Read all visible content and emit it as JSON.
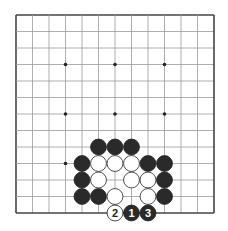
{
  "board": {
    "size": 13,
    "origin": {
      "x": 16,
      "y": 15
    },
    "spacing": 16.5,
    "line_color": "#9a9a9a",
    "edge_color": "#444444",
    "star_points": [
      [
        3,
        3
      ],
      [
        6,
        3
      ],
      [
        9,
        3
      ],
      [
        3,
        6
      ],
      [
        6,
        6
      ],
      [
        9,
        6
      ],
      [
        3,
        9
      ],
      [
        9,
        9
      ]
    ]
  },
  "stones": [
    {
      "color": "black",
      "x": 5,
      "y": 8
    },
    {
      "color": "black",
      "x": 6,
      "y": 8
    },
    {
      "color": "black",
      "x": 7,
      "y": 8
    },
    {
      "color": "black",
      "x": 4,
      "y": 9
    },
    {
      "color": "white",
      "x": 5,
      "y": 9
    },
    {
      "color": "white",
      "x": 6,
      "y": 9
    },
    {
      "color": "white",
      "x": 7,
      "y": 9
    },
    {
      "color": "black",
      "x": 8,
      "y": 9
    },
    {
      "color": "black",
      "x": 9,
      "y": 9
    },
    {
      "color": "black",
      "x": 4,
      "y": 10
    },
    {
      "color": "white",
      "x": 5,
      "y": 10
    },
    {
      "color": "white",
      "x": 7,
      "y": 10
    },
    {
      "color": "white",
      "x": 8,
      "y": 10
    },
    {
      "color": "black",
      "x": 9,
      "y": 10
    },
    {
      "color": "black",
      "x": 4,
      "y": 11
    },
    {
      "color": "black",
      "x": 5,
      "y": 11
    },
    {
      "color": "white",
      "x": 6,
      "y": 11
    },
    {
      "color": "white",
      "x": 8,
      "y": 11
    },
    {
      "color": "black",
      "x": 9,
      "y": 11
    },
    {
      "color": "white",
      "x": 6,
      "y": 12,
      "label": "2"
    },
    {
      "color": "black",
      "x": 7,
      "y": 12,
      "label": "1"
    },
    {
      "color": "black",
      "x": 8,
      "y": 12,
      "label": "3"
    }
  ]
}
